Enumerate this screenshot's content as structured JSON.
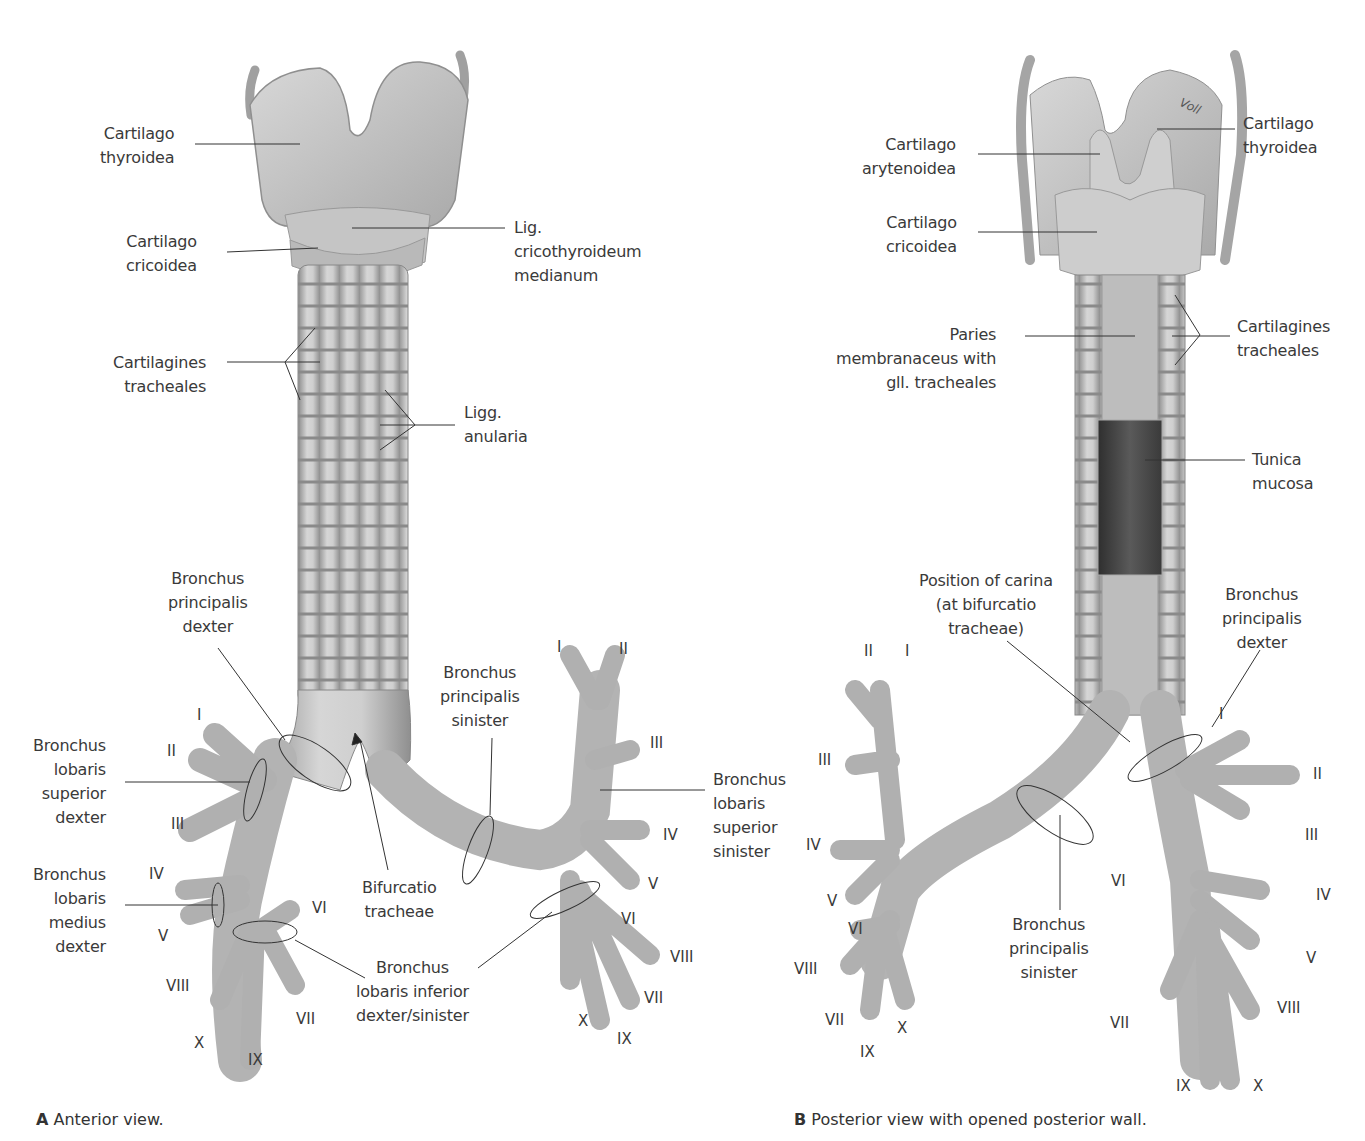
{
  "figure": {
    "panel_a": {
      "caption_letter": "A",
      "caption_text": "Anterior view.",
      "labels": {
        "cartilago_thyroidea": "Cartilago\nthyroidea",
        "lig_cricothyroideum": "Lig.\ncricothyroideum\nmedianum",
        "cartilago_cricoidea": "Cartilago\ncricoidea",
        "cartilagines_tracheales": "Cartilagines\ntracheales",
        "ligg_anularia": "Ligg.\nanularia",
        "bronchus_principalis_dexter": "Bronchus\nprincipalis\ndexter",
        "bronchus_principalis_sinister": "Bronchus\nprincipalis\nsinister",
        "bronchus_lobaris_superior_dexter": "Bronchus\nlobaris\nsuperior\ndexter",
        "bronchus_lobaris_medius_dexter": "Bronchus\nlobaris\nmedius\ndexter",
        "bifurcatio_tracheae": "Bifurcatio\ntracheae",
        "bronchus_lobaris_inferior": "Bronchus\nlobaris inferior\ndexter/sinister",
        "bronchus_lobaris_superior_sinister": "Bronchus\nlobaris\nsuperior\nsinister"
      },
      "segments_right": [
        "I",
        "II",
        "III",
        "IV",
        "V",
        "VI",
        "VII",
        "VIII",
        "IX",
        "X"
      ],
      "segments_left": [
        "I",
        "II",
        "III",
        "IV",
        "V",
        "VI",
        "VII",
        "VIII",
        "IX",
        "X"
      ]
    },
    "panel_b": {
      "caption_letter": "B",
      "caption_text": "Posterior view with opened posterior wall.",
      "labels": {
        "cartilago_arytenoidea": "Cartilago\narytenoidea",
        "cartilago_thyroidea": "Cartilago\nthyroidea",
        "cartilago_cricoidea": "Cartilago\ncricoidea",
        "paries_membranaceus": "Paries\nmembranaceus with\ngll. tracheales",
        "cartilagines_tracheales": "Cartilagines\ntracheales",
        "tunica_mucosa": "Tunica\nmucosa",
        "position_of_carina": "Position of carina\n(at bifurcatio\ntracheae)",
        "bronchus_principalis_dexter": "Bronchus\nprincipalis\ndexter",
        "bronchus_principalis_sinister": "Bronchus\nprincipalis\nsinister"
      },
      "segments_left": [
        "I",
        "II",
        "III",
        "IV",
        "V",
        "VI",
        "VII",
        "VIII",
        "IX",
        "X"
      ],
      "segments_right": [
        "I",
        "II",
        "III",
        "IV",
        "V",
        "VI",
        "VII",
        "VIII",
        "IX",
        "X"
      ],
      "signature": "Voll"
    },
    "colors": {
      "cartilage": "#c9c9c9",
      "cartilage_dark": "#9a9a9a",
      "mucosa": "#4a4a4a",
      "leader_line": "#333333"
    }
  }
}
